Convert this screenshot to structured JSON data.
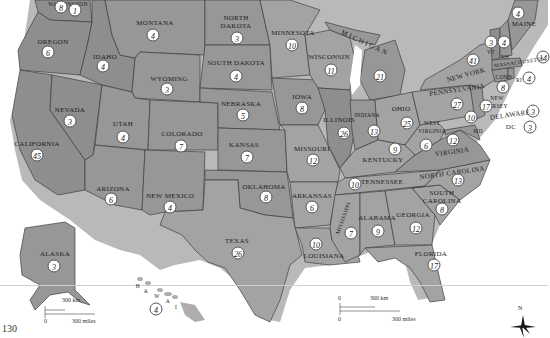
{
  "map": {
    "title": "United States electoral map (electoral votes by state)",
    "states": [
      {
        "name": "Washington",
        "label": "WASHINGTON",
        "votes": [
          "8",
          "1"
        ]
      },
      {
        "name": "Oregon",
        "label": "OREGON",
        "votes": "6"
      },
      {
        "name": "California",
        "label": "CALIFORNIA",
        "votes": "45"
      },
      {
        "name": "Nevada",
        "label": "NEVADA",
        "votes": "3"
      },
      {
        "name": "Idaho",
        "label": "IDAHO",
        "votes": "4"
      },
      {
        "name": "Montana",
        "label": "MONTANA",
        "votes": "4"
      },
      {
        "name": "Wyoming",
        "label": "WYOMING",
        "votes": "3"
      },
      {
        "name": "Utah",
        "label": "UTAH",
        "votes": "4"
      },
      {
        "name": "Colorado",
        "label": "COLORADO",
        "votes": "7"
      },
      {
        "name": "Arizona",
        "label": "ARIZONA",
        "votes": "6"
      },
      {
        "name": "New Mexico",
        "label": "NEW MEXICO",
        "votes": "4"
      },
      {
        "name": "North Dakota",
        "label": "NORTH DAKOTA",
        "votes": "3"
      },
      {
        "name": "South Dakota",
        "label": "SOUTH DAKOTA",
        "votes": "4"
      },
      {
        "name": "Nebraska",
        "label": "NEBRASKA",
        "votes": "5"
      },
      {
        "name": "Kansas",
        "label": "KANSAS",
        "votes": "7"
      },
      {
        "name": "Oklahoma",
        "label": "OKLAHOMA",
        "votes": "8"
      },
      {
        "name": "Texas",
        "label": "TEXAS",
        "votes": "26"
      },
      {
        "name": "Minnesota",
        "label": "MINNESOTA",
        "votes": "10"
      },
      {
        "name": "Iowa",
        "label": "IOWA",
        "votes": "8"
      },
      {
        "name": "Missouri",
        "label": "MISSOURI",
        "votes": "12"
      },
      {
        "name": "Arkansas",
        "label": "ARKANSAS",
        "votes": "6"
      },
      {
        "name": "Louisiana",
        "label": "LOUISIANA",
        "votes": "10"
      },
      {
        "name": "Wisconsin",
        "label": "WISCONSIN",
        "votes": "11"
      },
      {
        "name": "Illinois",
        "label": "ILLINOIS",
        "votes": "26"
      },
      {
        "name": "Michigan",
        "label": "MICHIGAN",
        "votes": "21"
      },
      {
        "name": "Indiana",
        "label": "INDIANA",
        "votes": "13"
      },
      {
        "name": "Ohio",
        "label": "OHIO",
        "votes": "25"
      },
      {
        "name": "Kentucky",
        "label": "KENTUCKY",
        "votes": "9"
      },
      {
        "name": "Tennessee",
        "label": "TENNESSEE",
        "votes": "10"
      },
      {
        "name": "Mississippi",
        "label": "MISSISSIPPI",
        "votes": "7"
      },
      {
        "name": "Alabama",
        "label": "ALABAMA",
        "votes": "9"
      },
      {
        "name": "Georgia",
        "label": "GEORGIA",
        "votes": "12"
      },
      {
        "name": "Florida",
        "label": "FLORIDA",
        "votes": "17"
      },
      {
        "name": "South Carolina",
        "label": "SOUTH CAROLINA",
        "votes": "8"
      },
      {
        "name": "North Carolina",
        "label": "NORTH CAROLINA",
        "votes": "13"
      },
      {
        "name": "Virginia",
        "label": "VIRGINIA",
        "votes": "12"
      },
      {
        "name": "West Virginia",
        "label": "WEST VIRGINIA",
        "votes": "6"
      },
      {
        "name": "Maryland",
        "label": "MD",
        "votes": "10"
      },
      {
        "name": "Delaware",
        "label": "DELAWARE",
        "votes": "3"
      },
      {
        "name": "District of Columbia",
        "label": "DC",
        "votes": "3"
      },
      {
        "name": "Pennsylvania",
        "label": "PENNSYLVANIA",
        "votes": "27"
      },
      {
        "name": "New Jersey",
        "label": "NEW JERSEY",
        "votes": "17"
      },
      {
        "name": "New York",
        "label": "NEW YORK",
        "votes": "41"
      },
      {
        "name": "Connecticut",
        "label": "CONN",
        "votes": "8"
      },
      {
        "name": "Rhode Island",
        "label": "RI",
        "votes": "4"
      },
      {
        "name": "Massachusetts",
        "label": "MASSACHUSETTS",
        "votes": "14"
      },
      {
        "name": "Vermont",
        "label": "VT",
        "votes": "3"
      },
      {
        "name": "New Hampshire",
        "label": "NH",
        "votes": "4"
      },
      {
        "name": "Maine",
        "label": "MAINE",
        "votes": "4"
      },
      {
        "name": "Alaska",
        "label": "ALASKA",
        "votes": "3"
      },
      {
        "name": "Hawaii",
        "label": "HAWAII",
        "votes": "4"
      }
    ],
    "inset_scale_alaska": {
      "km": "300 km",
      "miles": "300 miles",
      "zero": "0"
    },
    "inset_scale_main": {
      "zero_km": "0",
      "km": "300 km",
      "zero_mi": "0",
      "miles": "300 miles"
    },
    "compass": {
      "north": "N"
    },
    "longitude_label": "130"
  }
}
